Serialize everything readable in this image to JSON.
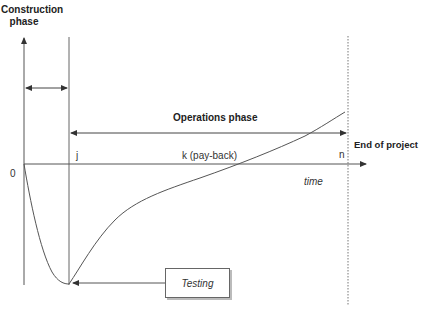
{
  "diagram": {
    "type": "cash-flow-curve",
    "y_axis_label": [
      "Construction",
      "phase"
    ],
    "operations_label": "Operations phase",
    "end_label": "End of project",
    "x_axis_label": "time",
    "origin_label": "0",
    "marker_j": "j",
    "marker_k": "k (pay-back)",
    "marker_n": "n",
    "callout_label": "Testing",
    "colors": {
      "line": "#555555",
      "text": "#222222",
      "box_shadow": "#bbbbbb"
    }
  }
}
